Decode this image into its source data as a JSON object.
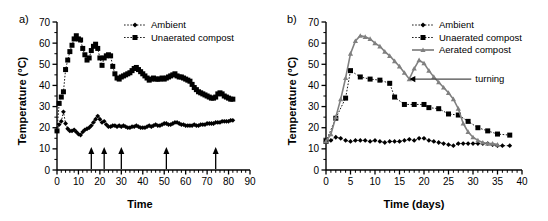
{
  "figure": {
    "panel_a_label": "a)",
    "panel_b_label": "b)"
  },
  "chart_data": [
    {
      "id": "panel_a",
      "type": "line",
      "title": "a)",
      "xlabel": "Time",
      "ylabel": "Temperature (°C)",
      "xlim": [
        0,
        90
      ],
      "ylim": [
        0,
        70
      ],
      "xticks": [
        0,
        10,
        20,
        30,
        40,
        50,
        60,
        70,
        80,
        90
      ],
      "yticks": [
        0,
        10,
        20,
        30,
        40,
        50,
        60,
        70
      ],
      "xtick_labels": [
        "0",
        "10",
        "20",
        "30",
        "40",
        "50",
        "60",
        "70",
        "80",
        "90"
      ],
      "ytick_labels": [
        "0",
        "10",
        "20",
        "30",
        "40",
        "50",
        "60",
        "70"
      ],
      "grid": false,
      "legend_position": "top-center",
      "minor_tick_interval": 2,
      "annotations": [
        {
          "type": "up-arrow",
          "x": 16,
          "label": ""
        },
        {
          "type": "up-arrow",
          "x": 22,
          "label": ""
        },
        {
          "type": "up-arrow",
          "x": 30,
          "label": ""
        },
        {
          "type": "up-arrow",
          "x": 51,
          "label": ""
        },
        {
          "type": "up-arrow",
          "x": 74,
          "label": ""
        }
      ],
      "series": [
        {
          "name": "Ambient",
          "marker": "diamond",
          "color": "#000000",
          "linestyle": "dotted",
          "x": [
            0,
            1,
            2,
            3,
            4,
            5,
            6,
            7,
            8,
            9,
            10,
            11,
            12,
            13,
            14,
            15,
            16,
            17,
            18,
            19,
            20,
            21,
            22,
            23,
            24,
            25,
            26,
            27,
            28,
            29,
            30,
            31,
            32,
            33,
            34,
            35,
            36,
            37,
            38,
            39,
            40,
            41,
            42,
            43,
            44,
            45,
            46,
            47,
            48,
            49,
            50,
            51,
            52,
            53,
            54,
            55,
            56,
            57,
            58,
            59,
            60,
            61,
            62,
            63,
            64,
            65,
            66,
            67,
            68,
            69,
            70,
            71,
            72,
            73,
            74,
            75,
            76,
            77,
            78,
            79,
            80,
            81,
            82
          ],
          "y": [
            18.5,
            21.5,
            23.0,
            27.5,
            22.0,
            19.5,
            18.5,
            18.5,
            19.0,
            18.0,
            17.0,
            16.5,
            18.0,
            19.0,
            19.5,
            20.0,
            21.0,
            22.5,
            24.0,
            25.5,
            24.0,
            22.5,
            23.0,
            21.5,
            20.5,
            20.5,
            21.0,
            21.0,
            20.5,
            21.0,
            20.5,
            21.0,
            20.5,
            20.0,
            20.0,
            20.5,
            20.5,
            21.0,
            20.5,
            20.0,
            20.0,
            20.0,
            20.5,
            21.0,
            20.5,
            21.0,
            21.5,
            21.0,
            21.0,
            21.5,
            22.0,
            22.0,
            21.5,
            21.5,
            22.0,
            22.5,
            22.5,
            22.0,
            21.5,
            21.5,
            21.0,
            21.0,
            21.0,
            21.0,
            21.5,
            21.0,
            21.0,
            21.5,
            21.5,
            21.5,
            22.0,
            22.0,
            22.0,
            22.0,
            22.5,
            22.5,
            22.5,
            23.0,
            23.0,
            23.0,
            23.0,
            23.5,
            23.5
          ]
        },
        {
          "name": "Unaerated compost",
          "marker": "square",
          "color": "#000000",
          "linestyle": "dotted",
          "x": [
            0,
            1,
            2,
            3,
            4,
            5,
            6,
            7,
            8,
            9,
            10,
            11,
            12,
            13,
            14,
            15,
            16,
            17,
            18,
            19,
            20,
            21,
            22,
            23,
            24,
            25,
            26,
            27,
            28,
            29,
            30,
            31,
            32,
            33,
            34,
            35,
            36,
            37,
            38,
            39,
            40,
            41,
            42,
            43,
            44,
            45,
            46,
            47,
            48,
            49,
            50,
            51,
            52,
            53,
            54,
            55,
            56,
            57,
            58,
            59,
            60,
            61,
            62,
            63,
            64,
            65,
            66,
            67,
            68,
            69,
            70,
            71,
            72,
            73,
            74,
            75,
            76,
            77,
            78,
            79,
            80,
            81,
            82
          ],
          "y": [
            18.5,
            31.5,
            34.5,
            37.0,
            47.5,
            52.0,
            56.0,
            59.0,
            62.0,
            63.5,
            62.0,
            61.5,
            57.5,
            54.5,
            52.0,
            53.0,
            56.5,
            58.5,
            59.5,
            57.5,
            53.0,
            49.5,
            53.0,
            54.0,
            54.5,
            54.0,
            49.0,
            45.5,
            43.5,
            43.0,
            44.0,
            44.5,
            45.0,
            45.5,
            46.0,
            47.0,
            48.0,
            48.5,
            47.5,
            46.5,
            45.5,
            44.5,
            43.5,
            42.5,
            43.0,
            43.5,
            43.0,
            43.0,
            43.0,
            43.5,
            43.0,
            43.5,
            44.0,
            44.5,
            45.0,
            45.5,
            44.5,
            44.0,
            44.0,
            43.5,
            43.0,
            42.5,
            42.0,
            40.5,
            39.0,
            38.0,
            37.0,
            36.5,
            36.0,
            35.5,
            35.0,
            34.5,
            34.0,
            34.0,
            34.5,
            36.0,
            36.5,
            36.0,
            35.0,
            34.5,
            34.0,
            33.5,
            33.5
          ]
        }
      ]
    },
    {
      "id": "panel_b",
      "type": "line",
      "title": "b)",
      "xlabel": "Time (days)",
      "ylabel": "Temperature (°C)",
      "xlim": [
        0,
        40
      ],
      "ylim": [
        0,
        70
      ],
      "xticks": [
        0,
        5,
        10,
        15,
        20,
        25,
        30,
        35,
        40
      ],
      "yticks": [
        0,
        10,
        20,
        30,
        40,
        50,
        60,
        70
      ],
      "xtick_labels": [
        "0",
        "5",
        "10",
        "15",
        "20",
        "25",
        "30",
        "35",
        "40"
      ],
      "ytick_labels": [
        "0",
        "10",
        "20",
        "30",
        "40",
        "50",
        "60",
        "70"
      ],
      "grid": false,
      "legend_position": "top-right",
      "minor_tick_interval": 1,
      "annotations": [
        {
          "type": "arrow-label",
          "label": "turning",
          "target_x": 17,
          "target_y": 43
        }
      ],
      "series": [
        {
          "name": "Ambient",
          "marker": "diamond",
          "color": "#000000",
          "linestyle": "dotted",
          "x": [
            0,
            1,
            2,
            3,
            4,
            5,
            6,
            7,
            8,
            9,
            10,
            11,
            12,
            13,
            14,
            15,
            16,
            17,
            18,
            19,
            20,
            21,
            22,
            23,
            24,
            25,
            26,
            27,
            28,
            29,
            30,
            31,
            32,
            33,
            34,
            35,
            36,
            37.5
          ],
          "y": [
            13.5,
            14.0,
            15.5,
            15.0,
            14.0,
            13.5,
            14.0,
            14.0,
            14.0,
            13.5,
            14.0,
            13.5,
            13.0,
            13.5,
            13.5,
            13.5,
            14.0,
            14.5,
            14.0,
            15.0,
            15.0,
            14.0,
            13.5,
            13.0,
            12.5,
            12.0,
            11.5,
            12.5,
            12.5,
            12.5,
            12.5,
            12.5,
            12.5,
            12.5,
            12.0,
            11.5,
            11.5,
            11.5
          ]
        },
        {
          "name": "Unaerated compost",
          "marker": "square",
          "color": "#000000",
          "linestyle": "dotted",
          "x": [
            0,
            2,
            4,
            5,
            7,
            9,
            11,
            13,
            14,
            16,
            18,
            20,
            21,
            23,
            25,
            27,
            29,
            31,
            33,
            35,
            37.5
          ],
          "y": [
            13.5,
            24.5,
            34.0,
            47.0,
            44.0,
            43.0,
            42.5,
            41.0,
            34.5,
            31.0,
            31.0,
            31.0,
            29.5,
            29.0,
            26.5,
            26.0,
            23.0,
            20.0,
            18.5,
            17.0,
            16.5
          ]
        },
        {
          "name": "Aerated compost",
          "marker": "triangle",
          "color": "#808080",
          "linestyle": "solid",
          "x": [
            0,
            1,
            2,
            3,
            4,
            5,
            6,
            7,
            8,
            9,
            10,
            11,
            12,
            13,
            14,
            15,
            16,
            17,
            18,
            19,
            20,
            21,
            22,
            23,
            24,
            25,
            26,
            27,
            28,
            29,
            30,
            31,
            32,
            33,
            34,
            35
          ],
          "y": [
            13.5,
            17.0,
            25.0,
            33.5,
            43.5,
            55.0,
            61.0,
            63.5,
            63.0,
            62.0,
            60.0,
            58.5,
            56.0,
            54.0,
            51.5,
            49.0,
            46.0,
            43.0,
            48.0,
            52.0,
            50.5,
            47.0,
            44.0,
            41.5,
            39.0,
            36.5,
            33.5,
            29.0,
            22.0,
            18.0,
            15.5,
            14.0,
            13.0,
            12.5,
            12.5,
            12.0
          ]
        }
      ]
    }
  ]
}
